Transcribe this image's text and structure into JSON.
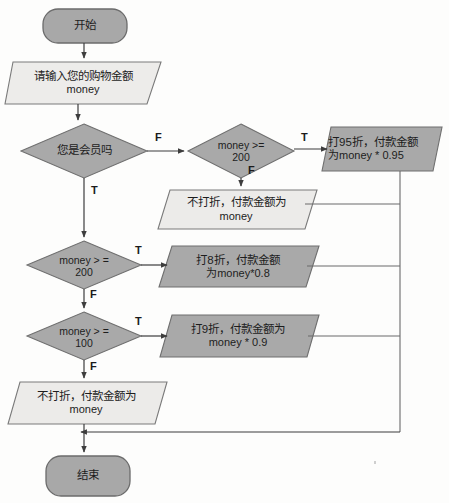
{
  "diagram": {
    "type": "flowchart",
    "title_text": "",
    "colors": {
      "fill_gray": "#a8a8a8",
      "fill_light": "#e6e6e4",
      "stroke": "#6f6f6f",
      "stroke_dark": "#4a4a4a",
      "text": "#1d1d1d",
      "background": "#fdfdfc"
    },
    "nodes": {
      "start": {
        "shape": "terminator",
        "fill": "gray",
        "label": "开始"
      },
      "input_money": {
        "shape": "parallelogram",
        "fill": "light",
        "line1": "请输入您的购物金额",
        "line2": "money"
      },
      "decide_member": {
        "shape": "diamond",
        "fill": "gray",
        "line1": "您是会员吗",
        "line2": ""
      },
      "decide_member_200": {
        "shape": "diamond",
        "fill": "gray",
        "line1": "money >=",
        "line2": "200"
      },
      "out_95": {
        "shape": "parallelogram",
        "fill": "gray",
        "line1": "打95折，付款金额",
        "line2": "为money * 0.95"
      },
      "out_nodiscount_member": {
        "shape": "parallelogram",
        "fill": "light",
        "line1": "不打折，付款金额为",
        "line2": "money"
      },
      "decide_200": {
        "shape": "diamond",
        "fill": "gray",
        "line1": "money > =",
        "line2": "200"
      },
      "out_80": {
        "shape": "parallelogram",
        "fill": "gray",
        "line1": "打8折，付款金额",
        "line2": "为money*0.8"
      },
      "decide_100": {
        "shape": "diamond",
        "fill": "gray",
        "line1": "money > =",
        "line2": "100"
      },
      "out_90": {
        "shape": "parallelogram",
        "fill": "gray",
        "line1": "打9折，付款金额为",
        "line2": "money * 0.9"
      },
      "out_nodiscount_final": {
        "shape": "parallelogram",
        "fill": "light",
        "line1": "不打折，付款金额为",
        "line2": "money"
      },
      "end": {
        "shape": "terminator",
        "fill": "gray",
        "label": "结束"
      }
    },
    "edge_labels": {
      "member_false": "F",
      "member_true": "T",
      "member200_true": "T",
      "member200_false": "F",
      "d200_true": "T",
      "d200_false": "F",
      "d100_true": "T",
      "d100_false": "F"
    }
  }
}
